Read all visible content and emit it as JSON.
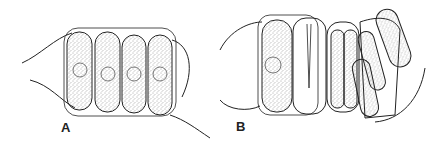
{
  "figure": {
    "panels": [
      {
        "id": "A",
        "label": "A",
        "description": "Four-celled colony with spines, each cell with central nucleus"
      },
      {
        "id": "B",
        "label": "B",
        "description": "Colony with empty cell, dividing cells and released autospores"
      }
    ],
    "colors": {
      "line": "#222222",
      "stipple": "#555555",
      "background": "#ffffff"
    }
  }
}
